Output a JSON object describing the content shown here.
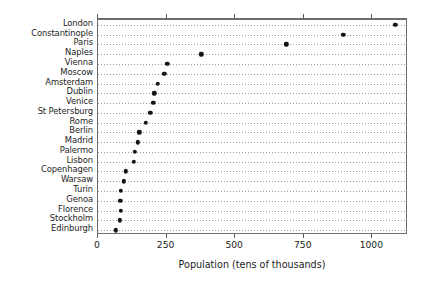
{
  "chart_data": {
    "type": "scatter",
    "title": "",
    "subtitle": "",
    "xlabel": "Population (tens of thousands)",
    "ylabel": "",
    "orientation": "horizontal",
    "grid": "dotted-horizontal",
    "legend": "none",
    "xlim": [
      0,
      1130
    ],
    "xticks": [
      0,
      250,
      500,
      750,
      1000
    ],
    "xticklabels": [
      "0",
      "250",
      "500",
      "750",
      "1000"
    ],
    "categories": [
      "London",
      "Constantinople",
      "Paris",
      "Naples",
      "Vienna",
      "Moscow",
      "Amsterdam",
      "Dublin",
      "Venice",
      "St Petersburg",
      "Rome",
      "Berlin",
      "Madrid",
      "Palermo",
      "Lisbon",
      "Copenhagen",
      "Warsaw",
      "Turin",
      "Genoa",
      "Florence",
      "Stockholm",
      "Edinburgh"
    ],
    "values": [
      1084,
      894,
      686,
      376,
      252,
      241,
      219,
      205,
      201,
      190,
      175,
      150,
      146,
      135,
      131,
      102,
      93,
      84,
      81,
      84,
      80,
      65
    ]
  },
  "axis": {
    "x_title": "Population (tens of thousands)"
  }
}
